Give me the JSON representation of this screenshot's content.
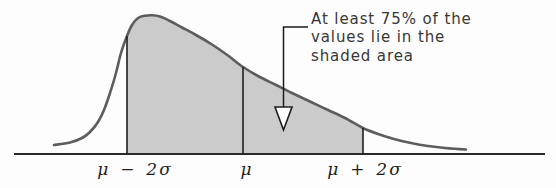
{
  "annotation": {
    "lines": [
      "At least 75% of the",
      "values lie in the",
      "shaded area"
    ],
    "leader": {
      "x": 283.5,
      "y_top": 27,
      "y_bottom": 107,
      "h_end_x": 308
    },
    "arrowhead": {
      "points": [
        [
          275,
          107
        ],
        [
          292,
          107
        ],
        [
          283.5,
          130
        ]
      ]
    }
  },
  "colors": {
    "background": "#fdfdfd",
    "shade": "#cbcbcb",
    "curve": "#5d5d5f",
    "axis": "#2b2b2b",
    "marker_line": "#1f1f1f",
    "leader": "#1c1c1c",
    "arrow_fill": "#ffffff",
    "text": "#383838",
    "label": "#1f1f1f"
  },
  "chart_data": {
    "type": "area",
    "title": "",
    "xlabel": "",
    "ylabel": "",
    "x_tick_labels": [
      "μ − 2σ",
      "μ",
      "μ + 2σ"
    ],
    "annotation_text": "At least 75% of the values lie in the shaded area",
    "shaded_interval": [
      "μ − 2σ",
      "μ + 2σ"
    ],
    "shaded_fraction_min": 0.75,
    "grid": "off",
    "axis": {
      "x1": 14,
      "x2": 545,
      "y": 154
    },
    "curve_points": [
      [
        54,
        145
      ],
      [
        70,
        142.5
      ],
      [
        82,
        138
      ],
      [
        90,
        132
      ],
      [
        98,
        122
      ],
      [
        104,
        110
      ],
      [
        110,
        93
      ],
      [
        116,
        73
      ],
      [
        121,
        53
      ],
      [
        127,
        36
      ],
      [
        132,
        25
      ],
      [
        138,
        18
      ],
      [
        145,
        15.7
      ],
      [
        152,
        15.3
      ],
      [
        160,
        16.5
      ],
      [
        170,
        21
      ],
      [
        182,
        27.5
      ],
      [
        196,
        35
      ],
      [
        212,
        44.5
      ],
      [
        228,
        55.5
      ],
      [
        243,
        67
      ],
      [
        258,
        76
      ],
      [
        274,
        84
      ],
      [
        292,
        93
      ],
      [
        311,
        102
      ],
      [
        328,
        110
      ],
      [
        345,
        118
      ],
      [
        363,
        128
      ],
      [
        378,
        134
      ],
      [
        394,
        139
      ],
      [
        411,
        143
      ],
      [
        428,
        146
      ],
      [
        445,
        148
      ],
      [
        466,
        149.5
      ]
    ],
    "shade_from_x": 127,
    "shade_to_x": 363,
    "markers": [
      {
        "label": "μ − 2σ",
        "x": 127,
        "label_x": 135
      },
      {
        "label": "μ",
        "x": 243,
        "label_x": 247
      },
      {
        "label": "μ + 2σ",
        "x": 363,
        "label_x": 365
      }
    ]
  }
}
